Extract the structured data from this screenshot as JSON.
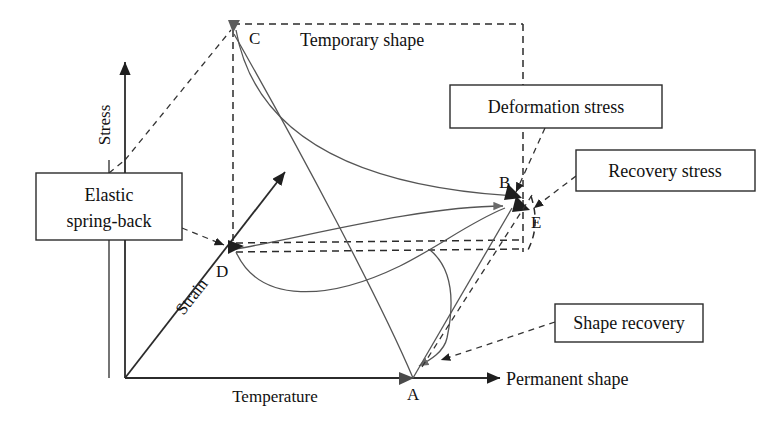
{
  "figure": {
    "type": "schematic-diagram"
  },
  "axes": {
    "vertical": {
      "label": "Stress",
      "icon": "up-arrow-axis"
    },
    "horizontal": {
      "label": "Temperature",
      "icon": "right-arrow-axis"
    },
    "depth": {
      "label": "Strain",
      "icon": "diagonal-arrow-axis"
    }
  },
  "points": [
    {
      "id": "A",
      "label": "A"
    },
    {
      "id": "B",
      "label": "B"
    },
    {
      "id": "C",
      "label": "C"
    },
    {
      "id": "D",
      "label": "D"
    },
    {
      "id": "E",
      "label": "E"
    }
  ],
  "free_labels": [
    {
      "name": "temporary-shape",
      "text": "Temporary shape"
    },
    {
      "name": "permanent-shape",
      "text": "Permanent shape"
    }
  ],
  "callouts": [
    {
      "name": "elastic-spring-back",
      "line1": "Elastic",
      "line2": "spring-back"
    },
    {
      "name": "deformation-stress",
      "text": "Deformation stress"
    },
    {
      "name": "recovery-stress",
      "text": "Recovery stress"
    },
    {
      "name": "shape-recovery",
      "text": "Shape recovery"
    }
  ],
  "colors": {
    "ink": "#2b2b2b",
    "curve": "#555555",
    "background": "#ffffff"
  }
}
